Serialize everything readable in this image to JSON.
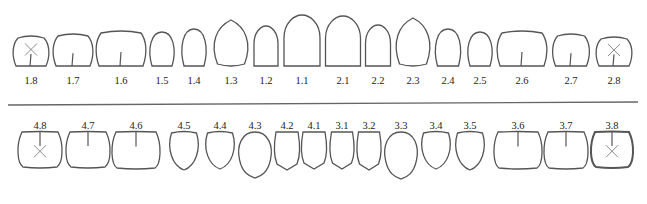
{
  "colors": {
    "outline": "#555555",
    "mark": "#8a8a8a",
    "divider": "#666666"
  },
  "upper": [
    {
      "id": "1.8",
      "cx": 31,
      "w": 36,
      "h": 30,
      "type": "molar",
      "missing": true
    },
    {
      "id": "1.7",
      "cx": 73,
      "w": 40,
      "h": 32,
      "type": "molar"
    },
    {
      "id": "1.6",
      "cx": 121,
      "w": 50,
      "h": 35,
      "type": "molar"
    },
    {
      "id": "1.5",
      "cx": 162,
      "w": 26,
      "h": 34,
      "type": "premolar"
    },
    {
      "id": "1.4",
      "cx": 194,
      "w": 26,
      "h": 37,
      "type": "premolar"
    },
    {
      "id": "1.3",
      "cx": 231,
      "w": 37,
      "h": 46,
      "type": "canine"
    },
    {
      "id": "1.2",
      "cx": 266,
      "w": 26,
      "h": 40,
      "type": "incisor"
    },
    {
      "id": "1.1",
      "cx": 302,
      "w": 38,
      "h": 51,
      "type": "incisor"
    },
    {
      "id": "2.1",
      "cx": 343,
      "w": 37,
      "h": 50,
      "type": "incisor"
    },
    {
      "id": "2.2",
      "cx": 378,
      "w": 27,
      "h": 41,
      "type": "incisor"
    },
    {
      "id": "2.3",
      "cx": 413,
      "w": 37,
      "h": 48,
      "type": "canine"
    },
    {
      "id": "2.4",
      "cx": 448,
      "w": 27,
      "h": 37,
      "type": "premolar"
    },
    {
      "id": "2.5",
      "cx": 480,
      "w": 26,
      "h": 34,
      "type": "premolar"
    },
    {
      "id": "2.6",
      "cx": 522,
      "w": 50,
      "h": 35,
      "type": "molar"
    },
    {
      "id": "2.7",
      "cx": 571,
      "w": 37,
      "h": 32,
      "type": "molar"
    },
    {
      "id": "2.8",
      "cx": 614,
      "w": 36,
      "h": 29,
      "type": "molar",
      "missing": true
    }
  ],
  "lower": [
    {
      "id": "4.8",
      "cx": 40,
      "w": 44,
      "h": 35,
      "type": "molar",
      "missing": true
    },
    {
      "id": "4.7",
      "cx": 88,
      "w": 44,
      "h": 35,
      "type": "molar"
    },
    {
      "id": "4.6",
      "cx": 136,
      "w": 48,
      "h": 36,
      "type": "molar"
    },
    {
      "id": "4.5",
      "cx": 184,
      "w": 31,
      "h": 38,
      "type": "premolar"
    },
    {
      "id": "4.4",
      "cx": 220,
      "w": 31,
      "h": 37,
      "type": "premolar"
    },
    {
      "id": "4.3",
      "cx": 255,
      "w": 33,
      "h": 46,
      "type": "canine"
    },
    {
      "id": "4.2",
      "cx": 287,
      "w": 26,
      "h": 38,
      "type": "incisor"
    },
    {
      "id": "4.1",
      "cx": 314,
      "w": 26,
      "h": 37,
      "type": "incisor"
    },
    {
      "id": "3.1",
      "cx": 342,
      "w": 25,
      "h": 37,
      "type": "incisor"
    },
    {
      "id": "3.2",
      "cx": 369,
      "w": 25,
      "h": 38,
      "type": "incisor"
    },
    {
      "id": "3.3",
      "cx": 401,
      "w": 33,
      "h": 47,
      "type": "canine"
    },
    {
      "id": "3.4",
      "cx": 436,
      "w": 31,
      "h": 37,
      "type": "premolar"
    },
    {
      "id": "3.5",
      "cx": 470,
      "w": 31,
      "h": 38,
      "type": "premolar"
    },
    {
      "id": "3.6",
      "cx": 518,
      "w": 48,
      "h": 36,
      "type": "molar"
    },
    {
      "id": "3.7",
      "cx": 566,
      "w": 44,
      "h": 36,
      "type": "molar"
    },
    {
      "id": "3.8",
      "cx": 612,
      "w": 42,
      "h": 35,
      "type": "molar",
      "missing": true
    }
  ],
  "layout": {
    "upper_bottom": 66,
    "upper_label_y": 82,
    "divider_y": 103,
    "lower_label_y": 127,
    "lower_top": 150
  }
}
